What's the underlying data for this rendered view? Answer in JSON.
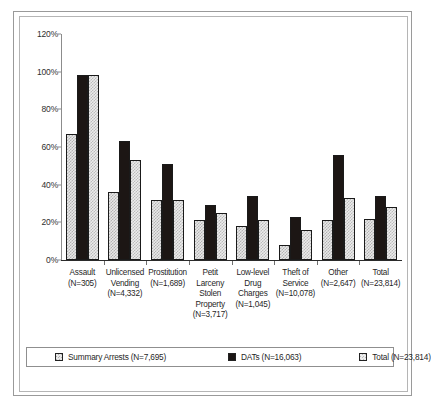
{
  "chart_data": {
    "type": "bar",
    "title": "",
    "xlabel": "",
    "ylabel": "",
    "ylim": [
      0,
      120
    ],
    "ytick_labels": [
      "120%",
      "100%",
      "80%",
      "60%",
      "40%",
      "20%",
      "0%"
    ],
    "ytick_values": [
      120,
      100,
      80,
      60,
      40,
      20,
      0
    ],
    "grid": false,
    "legend_position": "bottom",
    "categories": [
      "Assault\n(N=305)",
      "Unlicensed Vending\n(N=4,332)",
      "Prostitution\n(N=1,689)",
      "Petit Larceny Stolen Property\n(N=3,717)",
      "Low-level Drug Charges\n(N=1,045)",
      "Theft of Service\n(N=10,078)",
      "Other\n(N=2,647)",
      "Total\n(N=23,814)"
    ],
    "category_labels": [
      "Assault (N=305)",
      "Unlicensed Vending (N=4,332)",
      "Prostitution (N=1,689)",
      "Petit Larceny Stolen Property (N=3,717)",
      "Low-level Drug Charges (N=1,045)",
      "Theft of Service (N=10,078)",
      "Other (N=2,647)",
      "Total (N=23,814)"
    ],
    "series": [
      {
        "name": "Summary Arrests (N=7,695)",
        "values": [
          67,
          36,
          32,
          21,
          18,
          8,
          21,
          22
        ]
      },
      {
        "name": "DATs (N=16,063)",
        "values": [
          98,
          63,
          51,
          29,
          34,
          23,
          56,
          34
        ]
      },
      {
        "name": "Total (N=23,814)",
        "values": [
          98,
          53,
          32,
          25,
          21,
          16,
          33,
          28
        ]
      }
    ]
  },
  "axis": {
    "ticks": [
      {
        "label": "120%",
        "value": 120
      },
      {
        "label": "100%",
        "value": 100
      },
      {
        "label": "80%",
        "value": 80
      },
      {
        "label": "60%",
        "value": 60
      },
      {
        "label": "40%",
        "value": 40
      },
      {
        "label": "20%",
        "value": 20
      },
      {
        "label": "0%",
        "value": 0
      }
    ]
  },
  "categories": [
    {
      "name": "Assault",
      "count": "(N=305)",
      "lines": [
        "Assault",
        "(N=305)"
      ]
    },
    {
      "name": "Unlicensed Vending",
      "count": "(N=4,332)",
      "lines": [
        "Unlicensed",
        "Vending",
        "(N=4,332)"
      ]
    },
    {
      "name": "Prostitution",
      "count": "(N=1,689)",
      "lines": [
        "Prostitution",
        "(N=1,689)"
      ]
    },
    {
      "name": "Petit Larceny Stolen Property",
      "count": "(N=3,717)",
      "lines": [
        "Petit",
        "Larceny",
        "Stolen",
        "Property",
        "(N=3,717)"
      ]
    },
    {
      "name": "Low-level Drug Charges",
      "count": "(N=1,045)",
      "lines": [
        "Low-level",
        "Drug",
        "Charges",
        "(N=1,045)"
      ]
    },
    {
      "name": "Theft of Service",
      "count": "(N=10,078)",
      "lines": [
        "Theft of",
        "Service",
        "(N=10,078)"
      ]
    },
    {
      "name": "Other",
      "count": "(N=2,647)",
      "lines": [
        "Other",
        "(N=2,647)"
      ]
    },
    {
      "name": "Total",
      "count": "(N=23,814)",
      "lines": [
        "Total",
        "(N=23,814)"
      ]
    }
  ],
  "legend": {
    "items": [
      {
        "label": "Summary Arrests (N=7,695)",
        "swatch": "light"
      },
      {
        "label": "DATs (N=16,063)",
        "swatch": "dark"
      },
      {
        "label": "Total (N=23,814)",
        "swatch": "lightest"
      }
    ]
  }
}
